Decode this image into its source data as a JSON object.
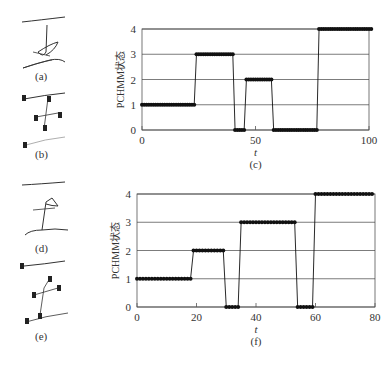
{
  "panels": {
    "a": {
      "label": "(a)"
    },
    "b": {
      "label": "(b)"
    },
    "c": {
      "label": "(c)"
    },
    "d": {
      "label": "(d)"
    },
    "e": {
      "label": "(e)"
    },
    "f": {
      "label": "(f)"
    }
  },
  "chart_data": [
    {
      "type": "line",
      "subtype": "step",
      "panel": "(c)",
      "title": "",
      "xlabel": "t",
      "ylabel": "PCHMM状态",
      "xlim": [
        0,
        100
      ],
      "ylim": [
        0,
        4
      ],
      "xticks": [
        0,
        50,
        100
      ],
      "yticks": [
        0,
        1,
        2,
        3,
        4
      ],
      "grid": "horizontal",
      "segments": [
        {
          "state": 1,
          "t_start": 0,
          "t_end": 23
        },
        {
          "state": 3,
          "t_start": 24,
          "t_end": 40
        },
        {
          "state": 0,
          "t_start": 41,
          "t_end": 45
        },
        {
          "state": 2,
          "t_start": 46,
          "t_end": 57
        },
        {
          "state": 0,
          "t_start": 58,
          "t_end": 77
        },
        {
          "state": 4,
          "t_start": 78,
          "t_end": 101
        }
      ]
    },
    {
      "type": "line",
      "subtype": "step",
      "panel": "(f)",
      "title": "",
      "xlabel": "t",
      "ylabel": "PCHMM状态",
      "xlim": [
        0,
        80
      ],
      "ylim": [
        0,
        4
      ],
      "xticks": [
        0,
        20,
        40,
        60,
        80
      ],
      "yticks": [
        0,
        1,
        2,
        3,
        4
      ],
      "grid": "horizontal",
      "segments": [
        {
          "state": 1,
          "t_start": 0,
          "t_end": 18
        },
        {
          "state": 2,
          "t_start": 19,
          "t_end": 29
        },
        {
          "state": 0,
          "t_start": 30,
          "t_end": 34
        },
        {
          "state": 3,
          "t_start": 35,
          "t_end": 53
        },
        {
          "state": 0,
          "t_start": 54,
          "t_end": 59
        },
        {
          "state": 4,
          "t_start": 60,
          "t_end": 79
        }
      ]
    }
  ],
  "layout": {
    "charts": [
      {
        "left": 142,
        "right": 369,
        "top": 29,
        "bottom": 130
      },
      {
        "left": 137,
        "right": 375,
        "top": 194,
        "bottom": 307
      }
    ]
  },
  "colors": {
    "line": "#111111",
    "grid": "#444444",
    "axis": "#555555"
  }
}
